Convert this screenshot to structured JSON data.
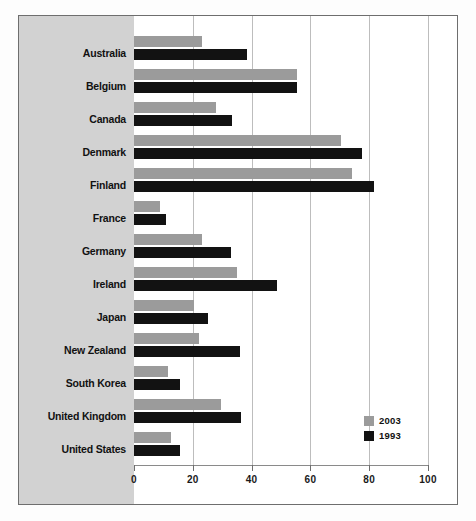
{
  "chart_data": {
    "type": "bar",
    "orientation": "horizontal",
    "title": "",
    "subtitle": "",
    "xlabel": "",
    "ylabel": "",
    "xlim": [
      0,
      100
    ],
    "xticks": [
      0,
      20,
      40,
      60,
      80,
      100
    ],
    "xtick_labels": [
      "0",
      "20",
      "40",
      "60",
      "80",
      "100"
    ],
    "grid": true,
    "grid_axis": "x",
    "legend_position": "bottom-right",
    "categories": [
      "Australia",
      "Belgium",
      "Canada",
      "Denmark",
      "Finland",
      "France",
      "Germany",
      "Ireland",
      "Japan",
      "New Zealand",
      "South Korea",
      "United Kingdom",
      "United States"
    ],
    "series": [
      {
        "name": "2003",
        "color": "#9b9b9b",
        "values": [
          23,
          55.5,
          28,
          70.5,
          74,
          9,
          23,
          35,
          20.5,
          22,
          11.5,
          29.5,
          12.5
        ]
      },
      {
        "name": "1993",
        "color": "#121212",
        "values": [
          38.5,
          55.5,
          33.5,
          77.5,
          81.5,
          11,
          33,
          48.5,
          25,
          36,
          15.5,
          36.5,
          15.5
        ]
      }
    ]
  },
  "legend": {
    "entries": [
      {
        "label": "2003",
        "color": "#9b9b9b"
      },
      {
        "label": "1993",
        "color": "#121212"
      }
    ]
  },
  "colors": {
    "series_2003": "#9b9b9b",
    "series_1993": "#121212",
    "label_panel_background": "#d2d2d2",
    "plot_background": "#ffffff",
    "gridline": "#bdbdbd",
    "frame_border": "#6e6e6e"
  }
}
